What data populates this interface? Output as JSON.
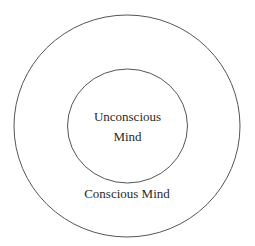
{
  "diagram": {
    "outer": {
      "label": "Conscious Mind"
    },
    "inner": {
      "label_line1": "Unconscious",
      "label_line2": "Mind"
    },
    "stroke_color": "#555555"
  }
}
